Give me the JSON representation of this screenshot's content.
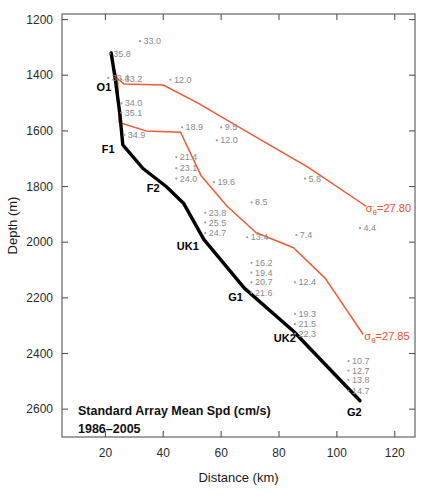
{
  "chart_data": {
    "type": "line",
    "title": "",
    "caption": {
      "line1": "Standard Array Mean Spd (cm/s)",
      "line2": "1986–2005"
    },
    "xlabel": "Distance (km)",
    "ylabel": "Depth (m)",
    "xlim": [
      5,
      127
    ],
    "ylim": [
      2700,
      1180
    ],
    "y_inverted": true,
    "grid": false,
    "legend": "none",
    "xticks": [
      20,
      40,
      60,
      80,
      100,
      120
    ],
    "xtick_labels": [
      "20",
      "40",
      "60",
      "80",
      "100",
      "120"
    ],
    "yticks": [
      1200,
      1400,
      1600,
      1800,
      2000,
      2200,
      2400,
      2600
    ],
    "ytick_labels": [
      "1200",
      "1400",
      "1600",
      "1800",
      "2000",
      "2200",
      "2400",
      "2600"
    ],
    "mooring_line": {
      "name": "Standard array mooring section",
      "color": "#000000",
      "points": [
        {
          "x": 22.0,
          "y": 1320
        },
        {
          "x": 23.5,
          "y": 1420
        },
        {
          "x": 25.0,
          "y": 1540
        },
        {
          "x": 26.0,
          "y": 1650
        },
        {
          "x": 33.0,
          "y": 1735
        },
        {
          "x": 41.0,
          "y": 1800
        },
        {
          "x": 47.0,
          "y": 1860
        },
        {
          "x": 54.0,
          "y": 1990
        },
        {
          "x": 68.0,
          "y": 2165
        },
        {
          "x": 85.0,
          "y": 2320
        },
        {
          "x": 108.0,
          "y": 2570
        }
      ]
    },
    "isopycnals": [
      {
        "name": "sigma0 = 27.80",
        "label": "27.80",
        "label_prefix": "σ",
        "label_subscript": "θ",
        "label_equals": "=",
        "color": "#ef5a32",
        "points": [
          {
            "x": 21.5,
            "y": 1320
          },
          {
            "x": 24.0,
            "y": 1410
          },
          {
            "x": 26.5,
            "y": 1432
          },
          {
            "x": 40.0,
            "y": 1435
          },
          {
            "x": 52.0,
            "y": 1500
          },
          {
            "x": 70.0,
            "y": 1610
          },
          {
            "x": 90.0,
            "y": 1730
          },
          {
            "x": 110.0,
            "y": 1870
          }
        ]
      },
      {
        "name": "sigma0 = 27.85",
        "label": "27.85",
        "label_prefix": "σ",
        "label_subscript": "θ",
        "label_equals": "=",
        "color": "#ef5a32",
        "points": [
          {
            "x": 24.2,
            "y": 1415
          },
          {
            "x": 24.8,
            "y": 1570
          },
          {
            "x": 34.0,
            "y": 1600
          },
          {
            "x": 46.0,
            "y": 1605
          },
          {
            "x": 53.0,
            "y": 1760
          },
          {
            "x": 62.0,
            "y": 1870
          },
          {
            "x": 72.0,
            "y": 1965
          },
          {
            "x": 85.0,
            "y": 2020
          },
          {
            "x": 96.0,
            "y": 2130
          },
          {
            "x": 109.0,
            "y": 2330
          }
        ]
      }
    ],
    "site_labels": [
      {
        "name": "O1",
        "text": "O1",
        "x": 19.5,
        "y": 1458
      },
      {
        "name": "F1",
        "text": "F1",
        "x": 21.0,
        "y": 1680
      },
      {
        "name": "F2",
        "text": "F2",
        "x": 36.5,
        "y": 1818
      },
      {
        "name": "UK1",
        "text": "UK1",
        "x": 48.5,
        "y": 2028
      },
      {
        "name": "G1",
        "text": "G1",
        "x": 65.0,
        "y": 2212
      },
      {
        "name": "UK2",
        "text": "UK2",
        "x": 82.0,
        "y": 2360
      },
      {
        "name": "G2",
        "text": "G2",
        "x": 106.0,
        "y": 2625
      }
    ],
    "speed_points": [
      {
        "value": "33.0",
        "x": 32.0,
        "y": 1288
      },
      {
        "value": "35.8",
        "x": 21.5,
        "y": 1333
      },
      {
        "value": "33.4",
        "x": 21.0,
        "y": 1420
      },
      {
        "value": "33.2",
        "x": 25.5,
        "y": 1425
      },
      {
        "value": "12.0",
        "x": 42.5,
        "y": 1427
      },
      {
        "value": "34.0",
        "x": 25.5,
        "y": 1512
      },
      {
        "value": "35.1",
        "x": 25.5,
        "y": 1545
      },
      {
        "value": "18.9",
        "x": 46.5,
        "y": 1598
      },
      {
        "value": "9.5",
        "x": 60.0,
        "y": 1598
      },
      {
        "value": "34.9",
        "x": 26.5,
        "y": 1625
      },
      {
        "value": "12.0",
        "x": 58.5,
        "y": 1645
      },
      {
        "value": "21.4",
        "x": 44.5,
        "y": 1705
      },
      {
        "value": "23.1",
        "x": 44.5,
        "y": 1745
      },
      {
        "value": "24.0",
        "x": 44.5,
        "y": 1782
      },
      {
        "value": "19.6",
        "x": 57.5,
        "y": 1795
      },
      {
        "value": "5.8",
        "x": 89.0,
        "y": 1782
      },
      {
        "value": "8.5",
        "x": 70.5,
        "y": 1868
      },
      {
        "value": "23.8",
        "x": 54.5,
        "y": 1905
      },
      {
        "value": "25.5",
        "x": 54.5,
        "y": 1940
      },
      {
        "value": "24.7",
        "x": 54.5,
        "y": 1978
      },
      {
        "value": "27.80",
        "x": 110.0,
        "y": 1890,
        "is_sigma": true
      },
      {
        "value": "4.4",
        "x": 108.0,
        "y": 1960
      },
      {
        "value": "13.4",
        "x": 69.0,
        "y": 1993
      },
      {
        "value": "7.4",
        "x": 86.0,
        "y": 1985
      },
      {
        "value": "16.2",
        "x": 70.5,
        "y": 2085
      },
      {
        "value": "19.4",
        "x": 70.5,
        "y": 2120
      },
      {
        "value": "20.7",
        "x": 70.5,
        "y": 2155
      },
      {
        "value": "12.4",
        "x": 85.5,
        "y": 2155
      },
      {
        "value": "21.6",
        "x": 70.5,
        "y": 2192
      },
      {
        "value": "19.3",
        "x": 85.5,
        "y": 2268
      },
      {
        "value": "21.5",
        "x": 85.5,
        "y": 2305
      },
      {
        "value": "22.3",
        "x": 85.5,
        "y": 2340
      },
      {
        "value": "27.85",
        "x": 109.5,
        "y": 2350,
        "is_sigma": true
      },
      {
        "value": "10.7",
        "x": 104.0,
        "y": 2438
      },
      {
        "value": "12.7",
        "x": 104.0,
        "y": 2472
      },
      {
        "value": "13.8",
        "x": 104.0,
        "y": 2505
      },
      {
        "value": "14.7",
        "x": 104.0,
        "y": 2545
      }
    ]
  }
}
